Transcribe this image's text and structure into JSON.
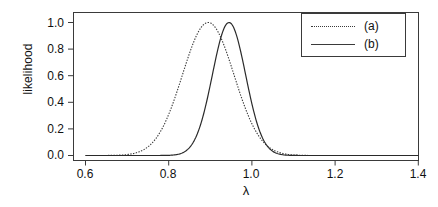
{
  "chart_data": {
    "type": "line",
    "title": "",
    "xlabel": "λ",
    "ylabel": "likelihood",
    "xlim": [
      0.6,
      1.4
    ],
    "ylim": [
      0.0,
      1.04
    ],
    "xticks": [
      "0.6",
      "0.8",
      "1.0",
      "1.2",
      "1.4"
    ],
    "xtick_values": [
      0.6,
      0.8,
      1.0,
      1.2,
      1.4
    ],
    "yticks": [
      "0.0",
      "0.2",
      "0.4",
      "0.6",
      "0.8",
      "1.0"
    ],
    "ytick_values": [
      0.0,
      0.2,
      0.4,
      0.6,
      0.8,
      1.0
    ],
    "grid": false,
    "legend_position": "top-right",
    "series": [
      {
        "name": "(a)",
        "style": "dotted",
        "color": "#3a3a3a",
        "peak_x": 0.895,
        "peak_y": 1.0,
        "sigma": 0.062,
        "x": [
          0.6,
          0.62,
          0.64,
          0.66,
          0.68,
          0.7,
          0.72,
          0.74,
          0.76,
          0.78,
          0.8,
          0.82,
          0.84,
          0.86,
          0.88,
          0.9,
          0.92,
          0.94,
          0.96,
          0.98,
          1.0,
          1.02,
          1.04,
          1.06,
          1.08,
          1.1,
          1.12,
          1.14,
          1.16,
          1.18,
          1.2,
          1.24,
          1.28,
          1.32,
          1.36,
          1.4
        ],
        "values": [
          0.0,
          0.0,
          0.0,
          0.0,
          0.001,
          0.002,
          0.006,
          0.016,
          0.038,
          0.081,
          0.155,
          0.266,
          0.41,
          0.568,
          0.722,
          0.842,
          0.945,
          0.992,
          0.985,
          0.927,
          0.83,
          0.708,
          0.576,
          0.449,
          0.334,
          0.237,
          0.16,
          0.103,
          0.063,
          0.037,
          0.021,
          0.006,
          0.001,
          0.0,
          0.0,
          0.0
        ]
      },
      {
        "name": "(b)",
        "style": "solid",
        "color": "#2a2a2a",
        "peak_x": 0.945,
        "peak_y": 1.0,
        "sigma": 0.04,
        "x": [
          0.6,
          0.64,
          0.68,
          0.72,
          0.76,
          0.78,
          0.8,
          0.82,
          0.84,
          0.86,
          0.88,
          0.9,
          0.92,
          0.94,
          0.96,
          0.98,
          1.0,
          1.02,
          1.04,
          1.06,
          1.08,
          1.1,
          1.12,
          1.14,
          1.16,
          1.18,
          1.2,
          1.24,
          1.28,
          1.32,
          1.36,
          1.4
        ],
        "values": [
          0.0,
          0.0,
          0.0,
          0.0,
          0.001,
          0.002,
          0.006,
          0.018,
          0.046,
          0.106,
          0.217,
          0.392,
          0.611,
          0.824,
          0.963,
          0.994,
          0.918,
          0.766,
          0.586,
          0.414,
          0.269,
          0.161,
          0.089,
          0.045,
          0.021,
          0.009,
          0.004,
          0.0,
          0.0,
          0.0,
          0.0,
          0.0
        ]
      }
    ]
  },
  "axes": {
    "ylabel": "likelihood",
    "xlabel": "λ",
    "ytick_labels": [
      "1.0",
      "0.8",
      "0.6",
      "0.4",
      "0.2",
      "0.0"
    ],
    "xtick_labels": [
      "0.6",
      "0.8",
      "1.0",
      "1.2",
      "1.4"
    ]
  },
  "legend": {
    "entries": [
      {
        "label": "(a)",
        "style": "dotted"
      },
      {
        "label": "(b)",
        "style": "solid"
      }
    ]
  },
  "colors": {
    "axis": "#3a3a3a",
    "series_a": "#3a3a3a",
    "series_b": "#2a2a2a",
    "background": "#ffffff"
  }
}
